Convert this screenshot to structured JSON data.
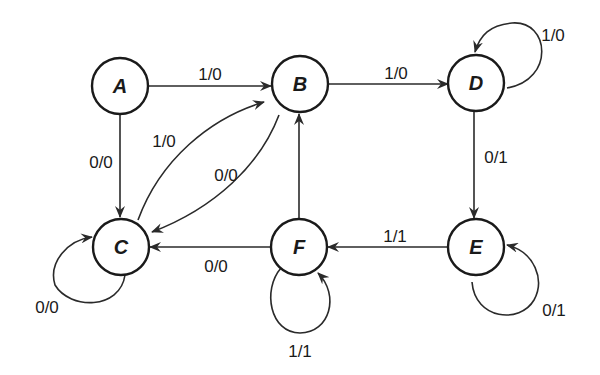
{
  "diagram": {
    "type": "state-machine",
    "nodes": [
      {
        "id": "A",
        "label": "A",
        "x": 120,
        "y": 86
      },
      {
        "id": "B",
        "label": "B",
        "x": 300,
        "y": 84
      },
      {
        "id": "D",
        "label": "D",
        "x": 477,
        "y": 82
      },
      {
        "id": "C",
        "label": "C",
        "x": 121,
        "y": 246
      },
      {
        "id": "F",
        "label": "F",
        "x": 299,
        "y": 246
      },
      {
        "id": "E",
        "label": "E",
        "x": 476,
        "y": 247
      }
    ],
    "edges": [
      {
        "from": "A",
        "to": "B",
        "label": "1/0"
      },
      {
        "from": "A",
        "to": "C",
        "label": "0/0"
      },
      {
        "from": "B",
        "to": "D",
        "label": "1/0"
      },
      {
        "from": "B",
        "to": "C",
        "label": "0/0"
      },
      {
        "from": "C",
        "to": "B",
        "label": "1/0"
      },
      {
        "from": "D",
        "to": "D",
        "label": "1/0"
      },
      {
        "from": "D",
        "to": "E",
        "label": "0/1"
      },
      {
        "from": "E",
        "to": "F",
        "label": "1/1"
      },
      {
        "from": "E",
        "to": "E",
        "label": "0/1"
      },
      {
        "from": "F",
        "to": "B",
        "label": "0/0"
      },
      {
        "from": "F",
        "to": "C",
        "label": "0/0"
      },
      {
        "from": "F",
        "to": "F",
        "label": "1/1"
      },
      {
        "from": "C",
        "to": "C",
        "label": "0/0"
      }
    ]
  },
  "labels": {
    "node_a": "A",
    "node_b": "B",
    "node_c": "C",
    "node_d": "D",
    "node_e": "E",
    "node_f": "F",
    "edge_a_b": "1/0",
    "edge_a_c": "0/0",
    "edge_b_d": "1/0",
    "edge_c_b": "1/0",
    "edge_b_c": "0/0",
    "edge_d_d": "1/0",
    "edge_d_e": "0/1",
    "edge_e_f": "1/1",
    "edge_e_e": "0/1",
    "edge_f_c": "0/0",
    "edge_f_f": "1/1",
    "edge_c_c": "0/0"
  }
}
